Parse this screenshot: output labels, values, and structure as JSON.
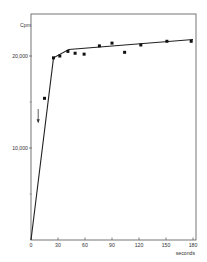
{
  "chart_data": {
    "type": "line",
    "title": "",
    "xlabel": "seconds",
    "ylabel": "Cpm",
    "xlim": [
      0,
      180
    ],
    "ylim": [
      0,
      24500
    ],
    "grid": false,
    "legend": null,
    "x_ticks": [
      0,
      30,
      60,
      90,
      120,
      150,
      180
    ],
    "x_tick_labels": [
      "0",
      "30",
      "60",
      "90",
      "120",
      "150",
      "180"
    ],
    "y_ticks_major": [
      10000,
      20000
    ],
    "y_tick_labels": [
      "10,000",
      "20,000"
    ],
    "y_ticks_minor": [
      5000,
      15000
    ],
    "series": [
      {
        "name": "measured",
        "style": "scatter",
        "marker": "square",
        "x": [
          15,
          25,
          32,
          41,
          49,
          59,
          76,
          90,
          104,
          122,
          151,
          178
        ],
        "y": [
          15400,
          19800,
          20000,
          20500,
          20300,
          20200,
          21100,
          21400,
          20400,
          21200,
          21600,
          21600
        ]
      },
      {
        "name": "fit",
        "style": "line",
        "x": [
          0,
          25,
          42,
          180
        ],
        "y": [
          0,
          19800,
          20700,
          21800
        ]
      }
    ],
    "annotations": [
      {
        "type": "arrow",
        "direction": "down",
        "x": 8,
        "y_from": 13800,
        "y_to": 12800
      }
    ]
  }
}
